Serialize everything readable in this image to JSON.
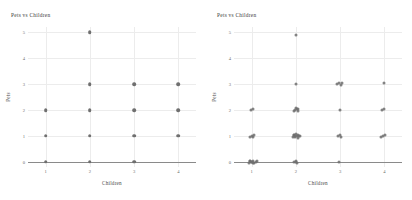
{
  "figure": {
    "background": "#ffffff",
    "dot_color": "#6f6f6f",
    "grid_color": "#ececec",
    "axis_color": "#8a8a8a",
    "panel_count": 2
  },
  "chart_data": [
    {
      "type": "scatter",
      "title": "Pets vs Children",
      "xlabel": "Children",
      "ylabel": "Pets",
      "xlim": [
        0.6,
        4.4
      ],
      "ylim": [
        -0.2,
        5.2
      ],
      "xticks": [
        1,
        2,
        3,
        4
      ],
      "yticks": [
        0,
        1,
        2,
        3,
        4,
        5
      ],
      "grid": true,
      "legend": "none",
      "jitter": false,
      "note": "overplotted integer lattice - identical values stack",
      "points": [
        {
          "x": 1,
          "y": 0
        },
        {
          "x": 1,
          "y": 1
        },
        {
          "x": 1,
          "y": 2
        },
        {
          "x": 2,
          "y": 0
        },
        {
          "x": 2,
          "y": 1
        },
        {
          "x": 2,
          "y": 2
        },
        {
          "x": 2,
          "y": 3
        },
        {
          "x": 2,
          "y": 5
        },
        {
          "x": 3,
          "y": 0
        },
        {
          "x": 3,
          "y": 1
        },
        {
          "x": 3,
          "y": 2
        },
        {
          "x": 3,
          "y": 3
        },
        {
          "x": 4,
          "y": 1
        },
        {
          "x": 4,
          "y": 2
        },
        {
          "x": 4,
          "y": 3
        }
      ]
    },
    {
      "type": "scatter",
      "title": "Pets vs Children",
      "xlabel": "Children",
      "ylabel": "Pets",
      "xlim": [
        0.6,
        4.4
      ],
      "ylim": [
        -0.2,
        5.2
      ],
      "xticks": [
        1,
        2,
        3,
        4
      ],
      "yticks": [
        0,
        1,
        2,
        3,
        4,
        5
      ],
      "grid": true,
      "legend": "none",
      "jitter": true,
      "note": "same data with jitter applied - cluster size reveals counts",
      "points": [
        {
          "x": 0.93,
          "y": -0.04
        },
        {
          "x": 0.97,
          "y": 0.02
        },
        {
          "x": 1.0,
          "y": -0.02
        },
        {
          "x": 1.03,
          "y": 0.04
        },
        {
          "x": 1.06,
          "y": -0.03
        },
        {
          "x": 1.09,
          "y": 0.01
        },
        {
          "x": 0.96,
          "y": 0.05
        },
        {
          "x": 1.04,
          "y": -0.05
        },
        {
          "x": 1.11,
          "y": 0.03
        },
        {
          "x": 0.99,
          "y": 0.0
        },
        {
          "x": 0.97,
          "y": 0.96
        },
        {
          "x": 1.01,
          "y": 1.0
        },
        {
          "x": 1.05,
          "y": 1.04
        },
        {
          "x": 1.03,
          "y": 0.95
        },
        {
          "x": 0.98,
          "y": 1.98
        },
        {
          "x": 1.02,
          "y": 2.02
        },
        {
          "x": 1.96,
          "y": -0.02
        },
        {
          "x": 2.0,
          "y": 0.03
        },
        {
          "x": 2.03,
          "y": -0.04
        },
        {
          "x": 2.01,
          "y": 0.0
        },
        {
          "x": 1.93,
          "y": 0.97
        },
        {
          "x": 1.96,
          "y": 1.02
        },
        {
          "x": 1.99,
          "y": 0.95
        },
        {
          "x": 2.02,
          "y": 1.0
        },
        {
          "x": 2.05,
          "y": 1.05
        },
        {
          "x": 2.07,
          "y": 0.98
        },
        {
          "x": 1.95,
          "y": 1.03
        },
        {
          "x": 2.04,
          "y": 0.93
        },
        {
          "x": 2.0,
          "y": 1.07
        },
        {
          "x": 2.09,
          "y": 1.01
        },
        {
          "x": 1.97,
          "y": 0.99
        },
        {
          "x": 1.96,
          "y": 1.96
        },
        {
          "x": 1.99,
          "y": 2.0
        },
        {
          "x": 2.02,
          "y": 2.05
        },
        {
          "x": 2.05,
          "y": 1.97
        },
        {
          "x": 2.0,
          "y": 2.08
        },
        {
          "x": 2.04,
          "y": 2.02
        },
        {
          "x": 2.0,
          "y": 3.02
        },
        {
          "x": 2.0,
          "y": 4.9
        },
        {
          "x": 2.98,
          "y": 0.0
        },
        {
          "x": 2.95,
          "y": 0.98
        },
        {
          "x": 2.99,
          "y": 1.02
        },
        {
          "x": 3.02,
          "y": 0.96
        },
        {
          "x": 3.0,
          "y": 1.99
        },
        {
          "x": 2.94,
          "y": 3.0
        },
        {
          "x": 2.98,
          "y": 3.05
        },
        {
          "x": 3.02,
          "y": 2.98
        },
        {
          "x": 3.05,
          "y": 3.03
        },
        {
          "x": 3.93,
          "y": 0.95
        },
        {
          "x": 3.97,
          "y": 1.0
        },
        {
          "x": 4.01,
          "y": 1.05
        },
        {
          "x": 3.95,
          "y": 1.98
        },
        {
          "x": 4.0,
          "y": 2.02
        },
        {
          "x": 4.0,
          "y": 3.03
        }
      ]
    }
  ]
}
